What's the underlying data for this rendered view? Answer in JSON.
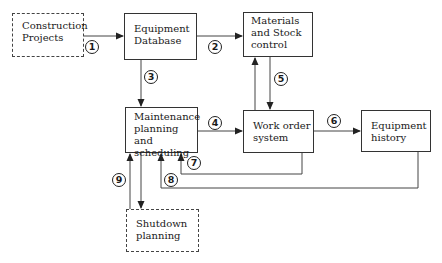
{
  "diagram": {
    "nodes": [
      {
        "id": "construction",
        "lines": [
          "Construction",
          "Projects"
        ],
        "style": "dashed"
      },
      {
        "id": "equipment_db",
        "lines": [
          "Equipment",
          "Database"
        ],
        "style": "solid"
      },
      {
        "id": "materials",
        "lines": [
          "Materials",
          "and Stock",
          "control"
        ],
        "style": "solid"
      },
      {
        "id": "maintenance",
        "lines": [
          "Maintenance",
          "planning and",
          "scheduling"
        ],
        "style": "solid"
      },
      {
        "id": "work_order",
        "lines": [
          "Work order",
          "system"
        ],
        "style": "solid"
      },
      {
        "id": "equipment_history",
        "lines": [
          "Equipment",
          "history"
        ],
        "style": "solid"
      },
      {
        "id": "shutdown",
        "lines": [
          "Shutdown",
          "planning"
        ],
        "style": "dashed"
      }
    ],
    "edges": [
      {
        "label": "1",
        "from": "construction",
        "to": "equipment_db"
      },
      {
        "label": "2",
        "from": "equipment_db",
        "to": "materials"
      },
      {
        "label": "3",
        "from": "equipment_db",
        "to": "maintenance"
      },
      {
        "label": "4",
        "from": "maintenance",
        "to": "work_order"
      },
      {
        "label": "5",
        "from": "materials",
        "to": "work_order"
      },
      {
        "label": "5b",
        "from": "work_order",
        "to": "materials"
      },
      {
        "label": "6",
        "from": "work_order",
        "to": "equipment_history"
      },
      {
        "label": "7",
        "from": "work_order",
        "to": "maintenance"
      },
      {
        "label": "8",
        "from": "equipment_history",
        "to": "maintenance"
      },
      {
        "label": "9",
        "from": "shutdown",
        "to": "maintenance"
      },
      {
        "label": "9b",
        "from": "maintenance",
        "to": "shutdown"
      }
    ],
    "labels": {
      "n1": "1",
      "n2": "2",
      "n3": "3",
      "n4": "4",
      "n5": "5",
      "n6": "6",
      "n7": "7",
      "n8": "8",
      "n9": "9"
    }
  }
}
